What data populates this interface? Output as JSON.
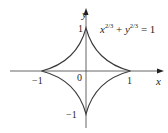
{
  "figure": {
    "type": "astroid",
    "equation": {
      "lhs_x": "x",
      "exp": "2/3",
      "plus": " + ",
      "lhs_y": "y",
      "rhs": " = 1"
    },
    "axes": {
      "x_label": "x",
      "y_label": "y",
      "origin_label": "0",
      "x_ticks": [
        "−1",
        "1"
      ],
      "y_ticks": [
        "1",
        "−1"
      ]
    },
    "colors": {
      "ink": "#231f20",
      "curve": "#4a4a4a",
      "axis": "#555555",
      "background": "#ffffff"
    }
  }
}
